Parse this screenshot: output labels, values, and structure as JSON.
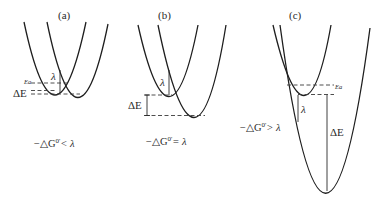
{
  "figure": {
    "panels": [
      {
        "id": "a",
        "label": "(a)",
        "lambda_label": "λ",
        "ea_label": "Ea",
        "de_label": "ΔE",
        "caption_prefix": "−△G",
        "caption_sup": "0'",
        "caption_relation": "< λ"
      },
      {
        "id": "b",
        "label": "(b)",
        "lambda_label": "λ",
        "de_label": "ΔE",
        "caption_prefix": "−△G",
        "caption_sup": "0'",
        "caption_relation": "= λ"
      },
      {
        "id": "c",
        "label": "(c)",
        "lambda_label": "λ",
        "ea_label": "Ea",
        "de_label": "ΔE",
        "caption_prefix": "−△G",
        "caption_sup": "0'",
        "caption_relation": "> λ"
      }
    ]
  }
}
